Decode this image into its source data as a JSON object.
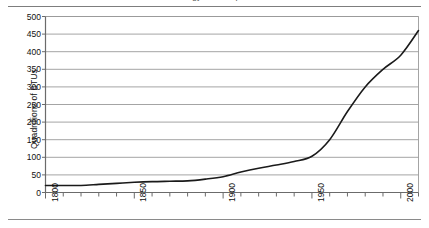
{
  "page": {
    "background_color": "#ffffff",
    "ink_color": "#1a1a1a",
    "grid_color": "#9a9a9a",
    "axis_color": "#6b6b6b",
    "title_fragment": "energy consumption"
  },
  "chart_data": {
    "type": "line",
    "title": "",
    "xlabel": "",
    "ylabel": "Quadrillions of BTUs",
    "xlim": [
      1800,
      2010
    ],
    "ylim": [
      0,
      500
    ],
    "ytick_step": 50,
    "xtick_major_step": 50,
    "xtick_minor_step": 10,
    "grid": "horizontal",
    "legend": "none",
    "line_color": "#1a1a1a",
    "line_width": 1.6,
    "ytick_labels": [
      "0",
      "50",
      "100",
      "150",
      "200",
      "250",
      "300",
      "350",
      "400",
      "450",
      "500"
    ],
    "ytick_values": [
      0,
      50,
      100,
      150,
      200,
      250,
      300,
      350,
      400,
      450,
      500
    ],
    "xtick_labels": [
      "1800",
      "1850",
      "1900",
      "1950",
      "2000"
    ],
    "xtick_values": [
      1800,
      1850,
      1900,
      1950,
      2000
    ],
    "series": [
      {
        "name": "Total energy consumption",
        "x": [
          1800,
          1810,
          1820,
          1830,
          1840,
          1850,
          1860,
          1870,
          1880,
          1890,
          1900,
          1910,
          1920,
          1930,
          1940,
          1950,
          1960,
          1970,
          1980,
          1990,
          2000,
          2010
        ],
        "values": [
          20,
          20,
          20,
          23,
          26,
          29,
          31,
          32,
          33,
          38,
          45,
          58,
          69,
          78,
          88,
          103,
          150,
          230,
          300,
          350,
          390,
          460
        ]
      }
    ]
  }
}
